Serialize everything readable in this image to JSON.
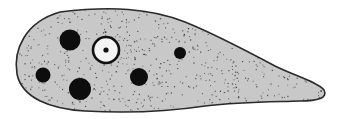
{
  "figure": {
    "colors": {
      "background": "#ffffff",
      "cytoplasm": "#c8c8c8",
      "outline": "#2a2a2a",
      "vacuole": "#0d0d0d",
      "nucleus_fill": "#f4f4f4",
      "nucleus_rim": "#111111",
      "granule": "#3a3a3a"
    },
    "body_path": "M 60 12 C 110 6, 150 8, 185 22 C 215 34, 245 50, 275 66 C 295 76, 318 82, 324 90 C 328 98, 318 101, 300 101 C 270 102, 240 102, 205 106 C 165 112, 120 113, 85 111 C 50 109, 22 98, 17 74 C 13 50, 25 22, 60 12 Z",
    "vacuoles": [
      {
        "cx": 70,
        "cy": 40,
        "r": 10.5
      },
      {
        "cx": 43,
        "cy": 75,
        "r": 7.5
      },
      {
        "cx": 80,
        "cy": 89,
        "r": 11
      },
      {
        "cx": 139,
        "cy": 77,
        "r": 9
      },
      {
        "cx": 180,
        "cy": 53,
        "r": 6
      }
    ],
    "nucleus": {
      "cx": 106,
      "cy": 50,
      "r": 13,
      "rim": 2.6,
      "nucleolus_r": 2.6
    }
  }
}
